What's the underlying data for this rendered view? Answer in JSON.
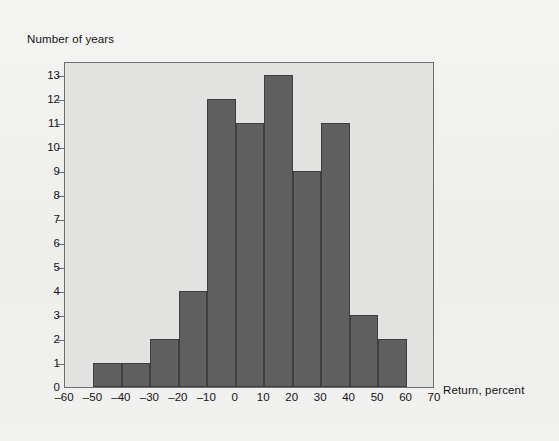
{
  "chart_data": {
    "type": "bar",
    "title": "",
    "subtitle": "",
    "xlabel": "Return, percent",
    "ylabel": "Number of years",
    "xlim": [
      -60,
      70
    ],
    "ylim": [
      0,
      13.6
    ],
    "grid": false,
    "legend": false,
    "bin_width": 10,
    "bin_edges": [
      -50,
      -40,
      -30,
      -20,
      -10,
      0,
      10,
      20,
      30,
      40,
      50,
      60
    ],
    "categories": [
      "-50 to -40",
      "-40 to -30",
      "-30 to -20",
      "-20 to -10",
      "-10 to 0",
      "0 to 10",
      "10 to 20",
      "20 to 30",
      "30 to 40",
      "40 to 50",
      "50 to 60"
    ],
    "values": [
      1,
      1,
      2,
      4,
      12,
      11,
      13,
      9,
      11,
      3,
      2
    ],
    "xticks": [
      -60,
      -50,
      -40,
      -30,
      -20,
      -10,
      0,
      10,
      20,
      30,
      40,
      50,
      60,
      70
    ],
    "xticklabels": [
      "–60",
      "–50",
      "–40",
      "–30",
      "–20",
      "–10",
      "0",
      "10",
      "20",
      "30",
      "40",
      "50",
      "60",
      "70"
    ],
    "yticks": [
      0,
      1,
      2,
      3,
      4,
      5,
      6,
      7,
      8,
      9,
      10,
      11,
      12,
      13
    ],
    "yticklabels": [
      "0",
      "1",
      "2",
      "3",
      "4",
      "5",
      "6",
      "7",
      "8",
      "9",
      "10",
      "11",
      "12",
      "13"
    ],
    "colors": {
      "bar_fill": "#5f5f5f",
      "bar_edge": "#3f3f3f",
      "plot_background": "#e2e2e1",
      "figure_background": "#f1f1f0",
      "axis": "#6d6d6d",
      "text": "#141414"
    }
  }
}
